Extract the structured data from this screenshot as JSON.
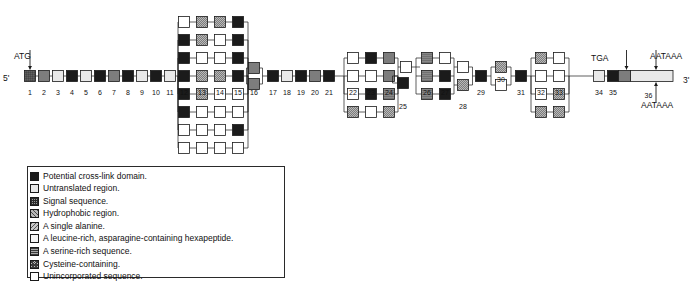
{
  "figure": {
    "type": "gene-structure-alternative-splicing-diagram",
    "five_prime_label": "5'",
    "three_prime_label": "3'",
    "start_codon_label": "ATG",
    "stop_codon_label": "TGA",
    "polya_label_top": "AATAAA",
    "polya_label_bottom": "AATAAA"
  },
  "legend": {
    "items": [
      {
        "pattern": "p-black",
        "key": "potential-cross-link-domain",
        "label": "Potential cross-link domain."
      },
      {
        "pattern": "p-untrans",
        "key": "untranslated-region",
        "label": "Untranslated region."
      },
      {
        "pattern": "p-signal",
        "key": "signal-sequence",
        "label": "Signal sequence."
      },
      {
        "pattern": "p-hydro",
        "key": "hydrophobic-region",
        "label": "Hydrophobic region."
      },
      {
        "pattern": "p-ala",
        "key": "single-alanine",
        "label": "A single alanine."
      },
      {
        "pattern": "p-leu",
        "key": "leucine-rich-hexapeptide",
        "label": "A leucine-rich, asparagine-containing hexapeptide."
      },
      {
        "pattern": "p-ser",
        "key": "serine-rich-sequence",
        "label": "A serine-rich sequence."
      },
      {
        "pattern": "p-cys",
        "key": "cysteine-containing",
        "label": "Cysteine-containing."
      },
      {
        "pattern": "p-unin",
        "key": "unincorporated-sequence",
        "label": "Unincorporated sequence."
      }
    ]
  },
  "exons_main": [
    {
      "n": "1",
      "x": 60,
      "pattern": "p-signal"
    },
    {
      "n": "2",
      "x": 88,
      "pattern": "p-cys"
    },
    {
      "n": "3",
      "x": 116,
      "pattern": "p-untrans"
    },
    {
      "n": "4",
      "x": 144,
      "pattern": "p-black"
    },
    {
      "n": "5",
      "x": 172,
      "pattern": "p-untrans"
    },
    {
      "n": "6",
      "x": 200,
      "pattern": "p-black"
    },
    {
      "n": "7",
      "x": 228,
      "pattern": "p-cys"
    },
    {
      "n": "8",
      "x": 256,
      "pattern": "p-black"
    },
    {
      "n": "9",
      "x": 284,
      "pattern": "p-untrans"
    },
    {
      "n": "10",
      "x": 312,
      "pattern": "p-black"
    },
    {
      "n": "11",
      "x": 340,
      "pattern": "p-untrans"
    }
  ],
  "exons_mid": [
    {
      "n": "17",
      "x": 546,
      "pattern": "p-black"
    },
    {
      "n": "18",
      "x": 574,
      "pattern": "p-untrans"
    },
    {
      "n": "19",
      "x": 602,
      "pattern": "p-black"
    },
    {
      "n": "20",
      "x": 630,
      "pattern": "p-cys"
    },
    {
      "n": "21",
      "x": 658,
      "pattern": "p-black"
    }
  ],
  "exons_tail": [
    {
      "n": "25",
      "x": 806,
      "pattern": "p-black"
    },
    {
      "n": "29",
      "x": 962,
      "pattern": "p-black"
    },
    {
      "n": "31",
      "x": 1042,
      "pattern": "p-black"
    },
    {
      "n": "34",
      "x": 1198,
      "pattern": "p-untrans"
    },
    {
      "n": "35",
      "x": 1226,
      "pattern": "p-black"
    }
  ],
  "stack_12_16": {
    "numbers": [
      {
        "n": "12",
        "x": 368
      },
      {
        "n": "13",
        "x": 404
      },
      {
        "n": "14",
        "x": 440
      },
      {
        "n": "15",
        "x": 476
      },
      {
        "n": "16",
        "x": 508
      }
    ],
    "rows": [
      [
        "p-unin",
        "p-hydro",
        "p-hydro",
        "p-black"
      ],
      [
        "p-black",
        "p-hydro",
        "p-unin",
        "p-black"
      ],
      [
        "p-black",
        "p-unin",
        "p-unin",
        "p-black"
      ],
      [
        "p-black",
        "p-hydro",
        "p-hydro",
        "p-black"
      ],
      [
        "p-black",
        "p-hydro",
        "p-unin",
        "p-unin"
      ],
      [
        "p-black",
        "p-unin",
        "p-unin",
        "p-unin"
      ],
      [
        "p-unin",
        "p-unin",
        "p-unin",
        "p-black"
      ],
      [
        "p-unin",
        "p-unin",
        "p-unin",
        "p-unin"
      ]
    ],
    "col16": [
      "p-cys",
      "p-cys"
    ]
  },
  "stack_22_24": {
    "numbers": [
      {
        "n": "22",
        "x": 706
      },
      {
        "n": "23",
        "x": 742
      },
      {
        "n": "24",
        "x": 778
      }
    ],
    "rows": [
      [
        "p-unin",
        "p-black",
        "p-cys"
      ],
      [
        "p-unin",
        "p-unin",
        "p-cys"
      ],
      [
        "p-unin",
        "p-black",
        "p-ser"
      ],
      [
        "p-hydro",
        "p-unin",
        "p-hydro"
      ]
    ],
    "bridge": [
      "p-unin"
    ]
  },
  "stack_26_28": {
    "numbers": [
      {
        "n": "26",
        "x": 854
      },
      {
        "n": "27",
        "x": 890
      },
      {
        "n": "28",
        "x": 926
      }
    ],
    "rows": [
      [
        "p-ser",
        "p-unin"
      ],
      [
        "p-ser",
        "p-black"
      ],
      [
        "p-ser",
        "p-black"
      ]
    ],
    "col28": [
      "p-unin",
      "p-hydro"
    ]
  },
  "stack_30": {
    "numbers": [
      {
        "n": "30",
        "x": 1002
      }
    ],
    "rows": [
      [
        "p-hydro"
      ],
      [
        "p-unin"
      ]
    ]
  },
  "stack_32_33": {
    "numbers": [
      {
        "n": "32",
        "x": 1082
      },
      {
        "n": "33",
        "x": 1118
      }
    ],
    "rows": [
      [
        "p-hydro",
        "p-unin"
      ],
      [
        "p-unin",
        "p-unin"
      ],
      [
        "p-unin",
        "p-hydro"
      ],
      [
        "p-hydro",
        "p-hydro"
      ]
    ]
  },
  "exon36": {
    "n": "36",
    "label": "36",
    "pattern": "p-untrans",
    "signal_pattern": "p-cys"
  }
}
